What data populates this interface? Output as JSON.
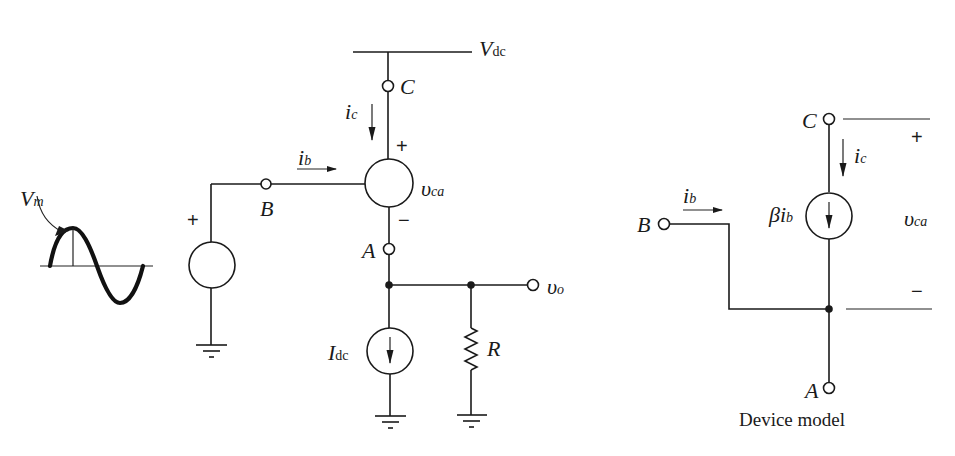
{
  "circuit": {
    "supply_label": "V",
    "supply_sub": "dc",
    "collector_label": "C",
    "base_label": "B",
    "emitter_label": "A",
    "collector_current": "i",
    "collector_current_sub": "c",
    "base_current": "i",
    "base_current_sub": "b",
    "device_voltage": "υ",
    "device_voltage_sub": "ca",
    "plus": "+",
    "minus": "−",
    "source_plus": "+",
    "input_amplitude": "V",
    "input_amplitude_sub": "m",
    "bias_current": "I",
    "bias_current_sub": "dc",
    "load_resistor": "R",
    "output_voltage": "υ",
    "output_voltage_sub": "o"
  },
  "model": {
    "collector_label": "C",
    "base_label": "B",
    "emitter_label": "A",
    "base_current": "i",
    "base_current_sub": "b",
    "collector_current": "i",
    "collector_current_sub": "c",
    "dependent_source": "βi",
    "dependent_source_sub": "b",
    "voltage": "υ",
    "voltage_sub": "ca",
    "plus": "+",
    "minus": "−",
    "caption": "Device model"
  },
  "colors": {
    "ink": "#1a1a1a",
    "background": "#ffffff"
  }
}
